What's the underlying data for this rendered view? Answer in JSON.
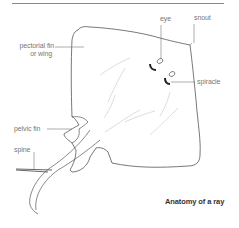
{
  "diagram": {
    "title": "Anatomy of a ray",
    "labels": {
      "eye": "eye",
      "snout": "snout",
      "pectoral_fin_line1": "pectorial fin",
      "pectoral_fin_line2": "or wing",
      "spiracle": "spiracle",
      "pelvic_fin": "pelvic fin",
      "spine": "spine"
    },
    "colors": {
      "outline": "#555555",
      "leader_line": "#777777",
      "texture": "#cfcfcf",
      "label_text": "#777777",
      "caption_text": "#333333",
      "rule": "#8a8a8a"
    }
  }
}
